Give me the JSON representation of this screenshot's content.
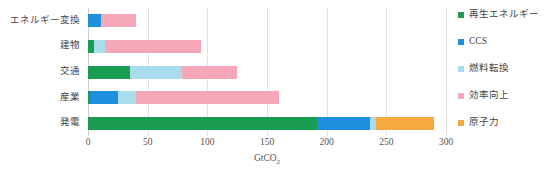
{
  "chart_data": {
    "type": "bar",
    "orientation": "horizontal",
    "stacked": true,
    "title": "",
    "xlabel": "GtCO2",
    "xlabel_display": "GtCO",
    "xlabel_sub": "2",
    "ylabel": "",
    "xlim": [
      0,
      300
    ],
    "xticks": [
      0,
      50,
      100,
      150,
      200,
      250,
      300
    ],
    "grid": true,
    "legend_position": "right",
    "categories": [
      "エネルギー変換",
      "建物",
      "交通",
      "産業",
      "発電"
    ],
    "series": [
      {
        "name": "再生エネルギー",
        "color": "#1a9c53",
        "values": [
          0,
          5,
          35,
          2,
          192
        ]
      },
      {
        "name": "CCS",
        "color": "#1f8fe0",
        "values": [
          11,
          0,
          0,
          23,
          44
        ]
      },
      {
        "name": "燃料転換",
        "color": "#a9dcec",
        "values": [
          0,
          9,
          44,
          15,
          5
        ]
      },
      {
        "name": "効率向上",
        "color": "#f7a8b8",
        "values": [
          29,
          81,
          46,
          120,
          0
        ]
      },
      {
        "name": "原子力",
        "color": "#f5a93f",
        "values": [
          0,
          0,
          0,
          0,
          49
        ]
      }
    ],
    "totals": [
      40,
      95,
      125,
      160,
      290
    ]
  },
  "legend": {
    "items": [
      {
        "label": "再生エネルギー",
        "color": "#1a9c53"
      },
      {
        "label": "CCS",
        "color": "#1f8fe0"
      },
      {
        "label": "燃料転換",
        "color": "#a9dcec"
      },
      {
        "label": "効率向上",
        "color": "#f7a8b8"
      },
      {
        "label": "原子力",
        "color": "#f5a93f"
      }
    ]
  }
}
